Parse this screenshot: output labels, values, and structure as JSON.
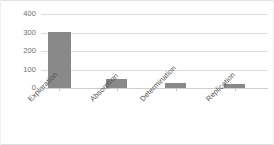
{
  "chart_data": {
    "type": "bar",
    "title": "",
    "subtitle": "",
    "xlabel": "",
    "ylabel": "",
    "categories": [
      "Exploration",
      "Absorption",
      "Determination",
      "Replication"
    ],
    "values": [
      305,
      50,
      25,
      22
    ],
    "series": [
      {
        "name": "",
        "values": [
          305,
          50,
          25,
          22
        ]
      }
    ],
    "ylim": [
      0,
      400
    ],
    "yticks": [
      0,
      100,
      200,
      300,
      400
    ],
    "ytick_labels": [
      "0",
      "100",
      "200",
      "300",
      "400"
    ],
    "grid": true,
    "grid_axis": "y",
    "legend": false,
    "legend_position": "none",
    "bar_color": "#898989",
    "gridline_color": "#dcdcdf",
    "axis_text_color": "#6e6e6e",
    "label_text_color": "#555555",
    "background_color": "#ffffff",
    "xlabel_rotation": -45
  }
}
